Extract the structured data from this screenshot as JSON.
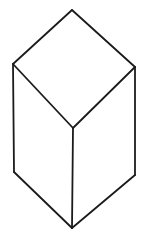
{
  "figure": {
    "type": "line-drawing",
    "canvas": {
      "width": 145,
      "height": 242,
      "background": "#ffffff"
    },
    "stroke": {
      "color": "#1b1b1b",
      "width": 1.8
    },
    "vertices": {
      "top": {
        "x": 72,
        "y": 10
      },
      "left": {
        "x": 13,
        "y": 64
      },
      "right": {
        "x": 135,
        "y": 67
      },
      "front_top": {
        "x": 73,
        "y": 128
      },
      "bottom_left": {
        "x": 14,
        "y": 172
      },
      "bottom_right": {
        "x": 135,
        "y": 175
      },
      "front_bottom": {
        "x": 72,
        "y": 228
      }
    },
    "edges": [
      [
        "top",
        "left"
      ],
      [
        "top",
        "right"
      ],
      [
        "left",
        "front_top"
      ],
      [
        "right",
        "front_top"
      ],
      [
        "left",
        "bottom_left"
      ],
      [
        "right",
        "bottom_right"
      ],
      [
        "front_top",
        "front_bottom"
      ],
      [
        "bottom_left",
        "front_bottom"
      ],
      [
        "bottom_right",
        "front_bottom"
      ]
    ]
  }
}
